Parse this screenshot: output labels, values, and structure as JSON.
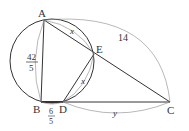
{
  "points": {
    "A": {
      "label": "A",
      "x": 44,
      "y": 20
    },
    "B": {
      "label": "B",
      "x": 41,
      "y": 102
    },
    "D": {
      "label": "D",
      "x": 63,
      "y": 102
    },
    "E": {
      "label": "E",
      "x": 94,
      "y": 54
    },
    "C": {
      "label": "C",
      "x": 170,
      "y": 102
    }
  },
  "circle": {
    "cx": 52,
    "cy": 61,
    "r": 42
  },
  "measurements": {
    "AB": {
      "numerator": "42",
      "denominator": "5"
    },
    "BD": {
      "numerator": "6",
      "denominator": "5"
    },
    "AE": "x",
    "ED": "x",
    "AC": "14",
    "DC": "y"
  },
  "colors": {
    "stroke": "#333333",
    "thin": "#888888",
    "background": "#ffffff"
  }
}
